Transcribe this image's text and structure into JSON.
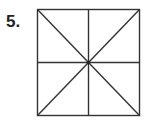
{
  "problem": {
    "number_label": "5.",
    "figure": {
      "shape": "square",
      "divisions": [
        "vertical-midline",
        "horizontal-midline",
        "diagonal-tl-br",
        "diagonal-tr-bl"
      ],
      "parts": 8,
      "stroke_color": "#333333",
      "center_dot": true
    }
  }
}
